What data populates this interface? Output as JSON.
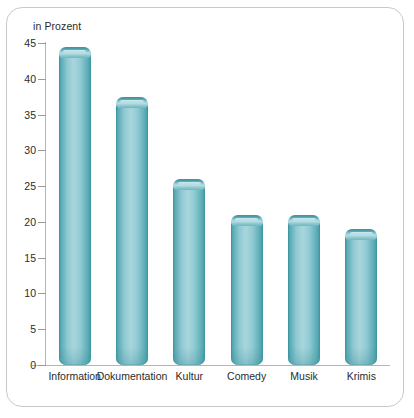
{
  "chart_data": {
    "type": "bar",
    "title": "",
    "subtitle": "",
    "xlabel": "",
    "ylabel": "in Prozent",
    "categories": [
      "Information",
      "Dokumentation",
      "Kultur",
      "Comedy",
      "Musik",
      "Krimis"
    ],
    "values": [
      44.5,
      37.5,
      26,
      21,
      21,
      19
    ],
    "ylim": [
      0,
      45
    ],
    "ytick_labels": [
      "0",
      "5",
      "10",
      "15",
      "20",
      "25",
      "30",
      "35",
      "40",
      "45"
    ],
    "ytick_values": [
      0,
      5,
      10,
      15,
      20,
      25,
      30,
      35,
      40,
      45
    ],
    "grid": false,
    "legend": false,
    "legend_position": "none",
    "bar_color": "#6fb8c2",
    "bar_edge_color": "#3d929e",
    "axis_color": "#b5b5b5",
    "text_color": "#2b2b2b",
    "background_color": "#ffffff",
    "border_color": "#c9c9c9"
  }
}
